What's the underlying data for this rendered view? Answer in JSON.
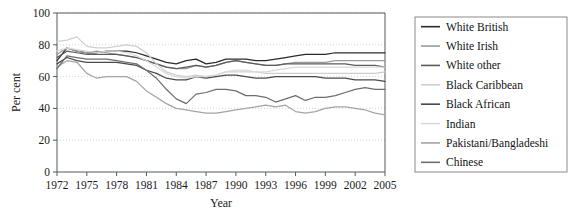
{
  "chart_data": {
    "type": "line",
    "title": "",
    "xlabel": "Year",
    "ylabel": "Per cent",
    "xlim": [
      1972,
      2005
    ],
    "ylim": [
      0,
      100
    ],
    "grid": true,
    "legend_position": "right",
    "x_ticks": [
      1972,
      1975,
      1978,
      1981,
      1984,
      1987,
      1990,
      1993,
      1996,
      1999,
      2002,
      2005
    ],
    "y_ticks": [
      0,
      20,
      40,
      60,
      80,
      100
    ],
    "x": [
      1972,
      1973,
      1974,
      1975,
      1976,
      1977,
      1978,
      1979,
      1980,
      1981,
      1982,
      1983,
      1984,
      1985,
      1986,
      1987,
      1988,
      1989,
      1990,
      1991,
      1992,
      1993,
      1994,
      1995,
      1996,
      1997,
      1998,
      1999,
      2000,
      2001,
      2002,
      2003,
      2004,
      2005
    ],
    "series": [
      {
        "name": "White British",
        "color": "#2b2b2b",
        "values": [
          70,
          78,
          76,
          75,
          75,
          76,
          76,
          76,
          75,
          73,
          71,
          69,
          68,
          70,
          71,
          68,
          69,
          71,
          71,
          71,
          70,
          70,
          71,
          72,
          73,
          74,
          74,
          74,
          75,
          75,
          75,
          75,
          75,
          75
        ]
      },
      {
        "name": "White Irish",
        "color": "#9a9a9a",
        "values": [
          74,
          78,
          76,
          75,
          76,
          75,
          74,
          73,
          72,
          70,
          68,
          66,
          65,
          65,
          67,
          66,
          67,
          69,
          70,
          69,
          68,
          67,
          67,
          68,
          69,
          69,
          69,
          69,
          70,
          70,
          70,
          70,
          70,
          70
        ]
      },
      {
        "name": "White other",
        "color": "#5c5c5c",
        "values": [
          72,
          76,
          75,
          74,
          74,
          74,
          74,
          73,
          72,
          70,
          68,
          66,
          65,
          66,
          67,
          66,
          67,
          69,
          70,
          69,
          68,
          67,
          67,
          68,
          68,
          68,
          68,
          68,
          68,
          68,
          67,
          67,
          67,
          66
        ]
      },
      {
        "name": "Black Caribbean",
        "color": "#cfcfcf",
        "values": [
          82,
          83,
          85,
          79,
          78,
          78,
          79,
          80,
          79,
          75,
          68,
          63,
          61,
          60,
          61,
          60,
          61,
          63,
          63,
          63,
          63,
          62,
          62,
          62,
          62,
          62,
          62,
          62,
          62,
          62,
          62,
          62,
          62,
          63
        ]
      },
      {
        "name": "Black African",
        "color": "#4a4a4a",
        "values": [
          68,
          72,
          70,
          69,
          69,
          69,
          69,
          68,
          67,
          64,
          62,
          59,
          58,
          58,
          60,
          59,
          60,
          61,
          61,
          60,
          59,
          59,
          60,
          60,
          60,
          60,
          60,
          59,
          59,
          59,
          58,
          58,
          58,
          57
        ]
      },
      {
        "name": "Indian",
        "color": "#d9d9d9",
        "values": [
          76,
          78,
          77,
          76,
          75,
          76,
          76,
          75,
          73,
          70,
          66,
          62,
          60,
          59,
          60,
          60,
          61,
          63,
          64,
          64,
          63,
          63,
          64,
          65,
          66,
          66,
          66,
          66,
          66,
          66,
          66,
          66,
          66,
          66
        ]
      },
      {
        "name": "Pakistani/Bangladeshi",
        "color": "#a5a5a5",
        "values": [
          66,
          70,
          69,
          62,
          59,
          60,
          60,
          60,
          57,
          51,
          47,
          43,
          40,
          39,
          38,
          37,
          37,
          38,
          39,
          40,
          41,
          42,
          41,
          42,
          38,
          37,
          38,
          40,
          41,
          41,
          40,
          39,
          37,
          36
        ]
      },
      {
        "name": "Chinese",
        "color": "#6e6e6e",
        "values": [
          65,
          73,
          72,
          71,
          71,
          71,
          70,
          69,
          68,
          64,
          59,
          52,
          46,
          43,
          49,
          50,
          52,
          52,
          51,
          48,
          48,
          47,
          44,
          46,
          48,
          45,
          47,
          47,
          48,
          50,
          52,
          53,
          52,
          52
        ]
      }
    ]
  },
  "legend": {
    "items": [
      {
        "label": "White British"
      },
      {
        "label": "White Irish"
      },
      {
        "label": "White other"
      },
      {
        "label": "Black Caribbean"
      },
      {
        "label": "Black African"
      },
      {
        "label": "Indian"
      },
      {
        "label": "Pakistani/Bangladeshi"
      },
      {
        "label": "Chinese"
      }
    ]
  }
}
